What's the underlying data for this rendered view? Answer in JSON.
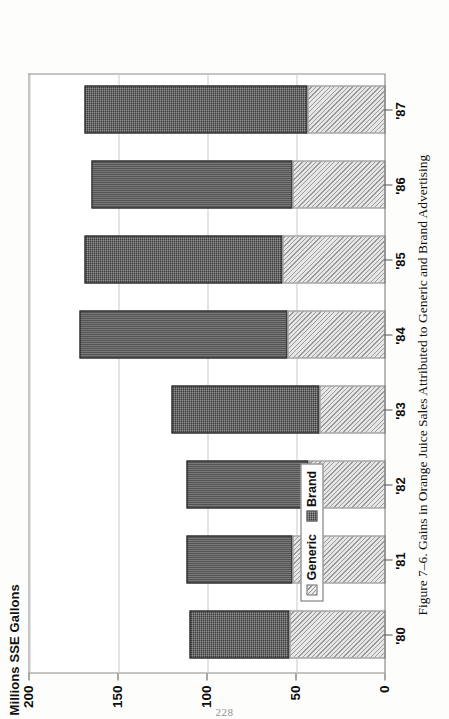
{
  "page": {
    "folio": "228"
  },
  "figure": {
    "caption": "Figure 7–6.  Gains in Orange Juice Sales Attributed to Generic and Brand Advertising"
  },
  "legend": {
    "position": "inside-upper-left",
    "items": [
      {
        "label": "Generic",
        "swatch": "hatched-light",
        "color": "#d8d8d8"
      },
      {
        "label": "Brand",
        "swatch": "stipple-dark",
        "color": "#3a3a3a"
      }
    ]
  },
  "axes": {
    "value_axis_title": "Millions SSE Gallons",
    "value_ticks": [
      "0",
      "50",
      "100",
      "150",
      "200"
    ],
    "category_ticks": [
      "'80",
      "'81",
      "'82",
      "'83",
      "'84",
      "'85",
      "'86",
      "'87"
    ]
  },
  "chart_data": {
    "type": "bar",
    "orientation": "vertical-stacked-printed-sideways",
    "title": "Millions SSE Gallons",
    "subtitle": "",
    "xlabel": "",
    "ylabel": "Millions SSE Gallons",
    "ylim": [
      0,
      200
    ],
    "ytick_values": [
      0,
      50,
      100,
      150,
      200
    ],
    "grid": true,
    "grid_axis": "value",
    "legend_position": "inside-upper-left",
    "stacked": true,
    "categories": [
      "'80",
      "'81",
      "'82",
      "'83",
      "'84",
      "'85",
      "'86",
      "'87"
    ],
    "series": [
      {
        "name": "Generic",
        "color": "#d8d8d8",
        "pattern": "diagonal-hatch",
        "values": [
          54,
          52,
          43,
          37,
          55,
          58,
          52,
          44
        ]
      },
      {
        "name": "Brand",
        "color": "#3a3a3a",
        "pattern": "dense-stipple",
        "values": [
          56,
          60,
          69,
          83,
          117,
          111,
          113,
          125
        ]
      }
    ],
    "totals": [
      110,
      112,
      112,
      120,
      172,
      169,
      165,
      169
    ]
  }
}
